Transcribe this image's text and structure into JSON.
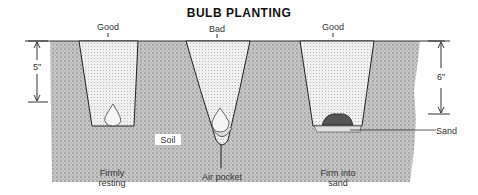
{
  "title": "BULB PLANTING",
  "holes": [
    {
      "top_label": "Good",
      "bottom_label_line1": "Firmly",
      "bottom_label_line2": "resting"
    },
    {
      "top_label": "Bad",
      "bottom_label_line1": "Air pocket",
      "bottom_label_line2": ""
    },
    {
      "top_label": "Good",
      "bottom_label_line1": "Firm into",
      "bottom_label_line2": "sand"
    }
  ],
  "dimensions": {
    "left": "5\"",
    "right": "6\""
  },
  "annotations": {
    "soil": "Soil",
    "sand": "Sand"
  },
  "colors": {
    "soil": "#bdbdbd",
    "fill": "#e4e4e4",
    "outline": "#222222"
  }
}
